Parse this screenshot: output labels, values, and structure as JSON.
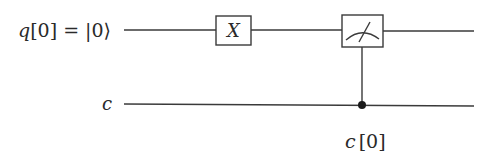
{
  "circuit": {
    "qubit_label": {
      "name": "q",
      "index": "[0]",
      "eq": " = ",
      "ket": "|0⟩"
    },
    "classical_label": "c",
    "gates": [
      {
        "type": "X",
        "label": "X"
      },
      {
        "type": "measure",
        "label": "measure-icon"
      }
    ],
    "measure_target_label": {
      "name": "c",
      "index": "[0]"
    }
  },
  "colors": {
    "line": "#3a3a3a",
    "text": "#2a2a2a",
    "background": "#ffffff"
  }
}
